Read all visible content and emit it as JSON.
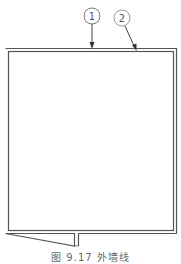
{
  "diagram": {
    "type": "floor-plan-outline",
    "callouts": [
      {
        "id": "1",
        "label": "1"
      },
      {
        "id": "2",
        "label": "2"
      }
    ],
    "caption": "图 9.17  外墙线",
    "colors": {
      "line": "#444444",
      "callout": "#777777",
      "caption": "#6a6a6a"
    }
  }
}
